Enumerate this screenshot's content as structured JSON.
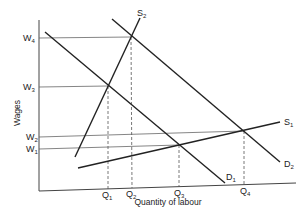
{
  "diagram": {
    "type": "labour-market-supply-demand",
    "y_axis_label": "Wages",
    "x_axis_label": "Quantity of labour",
    "wage_levels": [
      {
        "base": "W",
        "sub": "4"
      },
      {
        "base": "W",
        "sub": "3"
      },
      {
        "base": "W",
        "sub": "2"
      },
      {
        "base": "W",
        "sub": "1"
      }
    ],
    "quantity_levels": [
      {
        "base": "Q",
        "sub": "1"
      },
      {
        "base": "Q",
        "sub": "2"
      },
      {
        "base": "Q",
        "sub": "3"
      },
      {
        "base": "Q",
        "sub": "4"
      }
    ],
    "curves": [
      {
        "base": "S",
        "sub": "1",
        "kind": "supply"
      },
      {
        "base": "S",
        "sub": "2",
        "kind": "supply"
      },
      {
        "base": "D",
        "sub": "1",
        "kind": "demand"
      },
      {
        "base": "D",
        "sub": "2",
        "kind": "demand"
      }
    ],
    "equilibria": [
      {
        "curves": "S2-D1",
        "wage": "W3",
        "quantity": "Q1"
      },
      {
        "curves": "S2-D2",
        "wage": "W4",
        "quantity": "Q2"
      },
      {
        "curves": "S1-D1",
        "wage": "W1",
        "quantity": "Q3"
      },
      {
        "curves": "S1-D2",
        "wage": "W2",
        "quantity": "Q4"
      }
    ]
  }
}
